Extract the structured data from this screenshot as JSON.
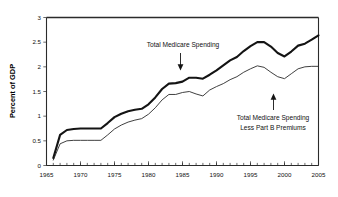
{
  "chart_data": {
    "type": "line",
    "title": "",
    "xlabel": "",
    "ylabel": "Percent of GDP",
    "xlim": [
      1965,
      2005
    ],
    "ylim": [
      0,
      3
    ],
    "grid": false,
    "legend": "annotations-inline",
    "x_ticks_major": [
      "1965",
      "1970",
      "1975",
      "1980",
      "1985",
      "1990",
      "1995",
      "2000",
      "2005"
    ],
    "x_tick_interval_minor": 1,
    "y_ticks": [
      "0",
      "0.5",
      "1",
      "1.5",
      "2",
      "2.5",
      "3"
    ],
    "x": [
      1966,
      1967,
      1968,
      1969,
      1970,
      1971,
      1972,
      1973,
      1974,
      1975,
      1976,
      1977,
      1978,
      1979,
      1980,
      1981,
      1982,
      1983,
      1984,
      1985,
      1986,
      1987,
      1988,
      1989,
      1990,
      1991,
      1992,
      1993,
      1994,
      1995,
      1996,
      1997,
      1998,
      1999,
      2000,
      2001,
      2002,
      2003,
      2004,
      2005
    ],
    "series": [
      {
        "name": "Total Medicare Spending",
        "style": "thick",
        "values": [
          0.15,
          0.62,
          0.72,
          0.74,
          0.75,
          0.75,
          0.75,
          0.75,
          0.86,
          0.98,
          1.05,
          1.1,
          1.13,
          1.15,
          1.24,
          1.38,
          1.55,
          1.66,
          1.67,
          1.7,
          1.78,
          1.78,
          1.76,
          1.84,
          1.93,
          2.03,
          2.13,
          2.2,
          2.32,
          2.42,
          2.5,
          2.5,
          2.41,
          2.28,
          2.21,
          2.31,
          2.43,
          2.47,
          2.55,
          2.64
        ]
      },
      {
        "name": "Total Medicare Spending Less Part B Premiums",
        "style": "thin",
        "values": [
          0.11,
          0.44,
          0.5,
          0.51,
          0.51,
          0.51,
          0.51,
          0.51,
          0.62,
          0.74,
          0.82,
          0.88,
          0.92,
          0.95,
          1.04,
          1.17,
          1.33,
          1.44,
          1.44,
          1.48,
          1.5,
          1.45,
          1.41,
          1.53,
          1.6,
          1.66,
          1.74,
          1.8,
          1.89,
          1.96,
          2.02,
          1.99,
          1.89,
          1.8,
          1.76,
          1.86,
          1.96,
          2.0,
          2.01,
          2.01
        ]
      }
    ],
    "annotations": [
      {
        "id": "annot-total-medicare-spending",
        "text": "Total Medicare Spending",
        "lines": [
          "Total Medicare Spending"
        ],
        "arrow": "down",
        "points_to_series": "Total Medicare Spending",
        "points_to_year": 1986
      },
      {
        "id": "annot-less-part-b",
        "text": "Total Medicare Spending Less Part B Premiums",
        "lines": [
          "Total Medicare Spending",
          "Less Part B Premiums"
        ],
        "arrow": "up",
        "points_to_series": "Total Medicare Spending Less Part B Premiums",
        "points_to_year": 1999
      }
    ],
    "colors": {
      "thick_series": "#141414",
      "thin_series": "#2a2a2a",
      "axis": "#2b2b2b",
      "text": "#111111",
      "background": "#ffffff"
    }
  }
}
